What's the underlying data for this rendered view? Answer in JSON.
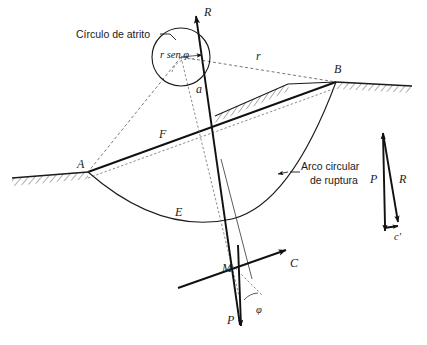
{
  "figure": {
    "background_color": "#ffffff",
    "line_color": "#1a1a1a",
    "dashed_color": "#666666"
  },
  "annotations": {
    "friction_circle_label": "Círculo de atrito",
    "rupture_arc_label_line1": "Arco circular",
    "rupture_arc_label_line2": "de ruptura",
    "r_sen_phi": "r sen φ"
  },
  "point_labels": {
    "A": "A",
    "B": "B",
    "M": "M",
    "E": "E",
    "F": "F",
    "C": "C",
    "R_top": "R",
    "P_bottom": "P",
    "a": "a",
    "r": "r",
    "phi": "φ"
  },
  "force_triangle": {
    "P": "P",
    "R": "R",
    "c_prime": "c'"
  },
  "geometry": {
    "point_A": [
      88,
      172
    ],
    "point_B": [
      336,
      82
    ],
    "point_M": [
      233,
      270
    ],
    "circle_center": [
      181,
      57
    ],
    "circle_radius": 29,
    "R_arrow_tip": [
      196,
      12
    ],
    "P_arrow_tip": [
      241,
      330
    ],
    "C_arrow_tip": [
      288,
      249
    ]
  }
}
